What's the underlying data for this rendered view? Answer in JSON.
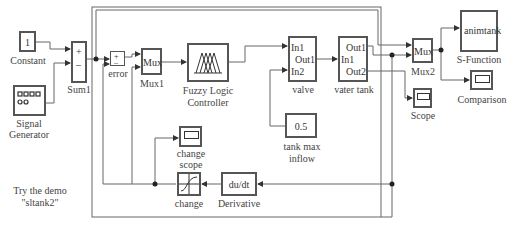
{
  "blocks": {
    "constant": {
      "value": "1",
      "label": "Constant"
    },
    "sum1": {
      "label": "Sum1",
      "signs": [
        "+",
        "–"
      ]
    },
    "signal_generator": {
      "label_line1": "Signal",
      "label_line2": "Generator"
    },
    "error": {
      "label": "error",
      "signs": [
        "+",
        "–"
      ]
    },
    "mux1": {
      "text": "Mux",
      "label": "Mux1"
    },
    "fuzzy": {
      "label_line1": "Fuzzy Logic",
      "label_line2": "Controller"
    },
    "valve": {
      "in1": "In1",
      "out1": "Out1",
      "in2": "In2",
      "label": "valve"
    },
    "water_tank": {
      "out1": "Out1",
      "in1": "In1",
      "out2": "Out2",
      "label": "vater tank"
    },
    "mux2": {
      "text": "Mux",
      "label": "Mux2"
    },
    "sfunction": {
      "text": "animtank",
      "label": "S-Function"
    },
    "comparison": {
      "label": "Comparison"
    },
    "scope": {
      "label": "Scope"
    },
    "tank_max_inflow": {
      "value": "0.5",
      "label_line1": "tank max",
      "label_line2": "inflow"
    },
    "change_scope": {
      "label_line1": "change",
      "label_line2": "scope"
    },
    "change": {
      "label": "change"
    },
    "derivative": {
      "text": "du/dt",
      "label": "Derivative"
    }
  },
  "annotation": {
    "line1": "Try the demo",
    "line2": "\"sltank2\""
  },
  "colors": {
    "block_border": "#555555",
    "wire": "#666666",
    "background": "#ffffff"
  }
}
